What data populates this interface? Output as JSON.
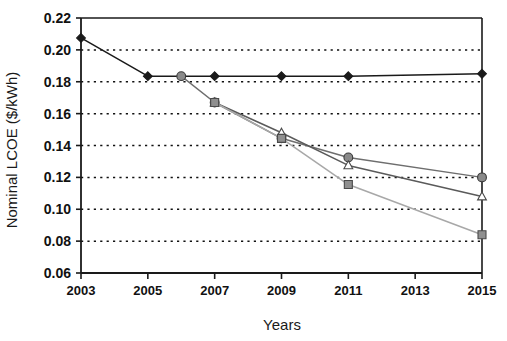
{
  "chart_data": {
    "type": "line",
    "title": "",
    "xlabel": "Years",
    "ylabel": "Nominal LCOE ($/kWh)",
    "x": [
      2003,
      2005,
      2006,
      2007,
      2009,
      2011,
      2015
    ],
    "xlim": [
      2003,
      2015
    ],
    "ylim": [
      0.06,
      0.22
    ],
    "grid": "horizontal-dotted",
    "legend": "none",
    "x_tick_labels": [
      "2003",
      "2005",
      "2007",
      "2009",
      "2011",
      "2013",
      "2015"
    ],
    "x_tick_values": [
      2003,
      2005,
      2007,
      2009,
      2011,
      2013,
      2015
    ],
    "y_tick_labels": [
      "0.22",
      "0.20",
      "0.18",
      "0.16",
      "0.14",
      "0.12",
      "0.10",
      "0.08",
      "0.06"
    ],
    "y_tick_values": [
      0.22,
      0.2,
      0.18,
      0.16,
      0.14,
      0.12,
      0.1,
      0.08,
      0.06
    ],
    "series": [
      {
        "name": "series-black-diamond",
        "marker": "diamond",
        "color": "#1a1a1a",
        "line_color": "#1a1a1a",
        "points": [
          {
            "x": 2003,
            "y": 0.2075
          },
          {
            "x": 2005,
            "y": 0.1835
          },
          {
            "x": 2007,
            "y": 0.1835
          },
          {
            "x": 2009,
            "y": 0.1835
          },
          {
            "x": 2011,
            "y": 0.1835
          },
          {
            "x": 2015,
            "y": 0.185
          }
        ]
      },
      {
        "name": "series-dark-gray-circle",
        "marker": "circle",
        "color": "#8a8a8a",
        "line_color": "#6e6e6e",
        "points": [
          {
            "x": 2006,
            "y": 0.1835
          },
          {
            "x": 2007,
            "y": 0.167
          },
          {
            "x": 2009,
            "y": 0.1445
          },
          {
            "x": 2011,
            "y": 0.1325
          },
          {
            "x": 2015,
            "y": 0.12
          }
        ]
      },
      {
        "name": "series-gray-triangle",
        "marker": "triangle",
        "color": "#9a9a9a",
        "line_color": "#5a5a5a",
        "points": [
          {
            "x": 2007,
            "y": 0.167
          },
          {
            "x": 2009,
            "y": 0.148
          },
          {
            "x": 2011,
            "y": 0.1275
          },
          {
            "x": 2015,
            "y": 0.108
          }
        ]
      },
      {
        "name": "series-light-gray-square",
        "marker": "square",
        "color": "#8f8f8f",
        "line_color": "#a8a8a8",
        "points": [
          {
            "x": 2007,
            "y": 0.167
          },
          {
            "x": 2009,
            "y": 0.1445
          },
          {
            "x": 2011,
            "y": 0.1155
          },
          {
            "x": 2015,
            "y": 0.084
          }
        ]
      }
    ]
  }
}
